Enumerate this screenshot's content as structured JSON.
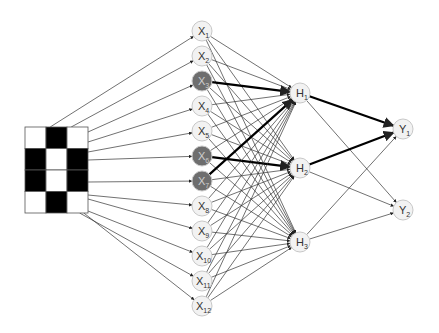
{
  "diagram": {
    "title": "",
    "type": "neural-network",
    "colors": {
      "background": "#ffffff",
      "node_fill": "#f2f2f2",
      "node_stroke": "#c8c8c8",
      "active_node_fill": "#6e6e6e",
      "edge": "#333333",
      "strong_edge": "#000000",
      "pixel_on": "#000000",
      "pixel_off": "#ffffff"
    },
    "input_grid": {
      "rows": 4,
      "cols": 3,
      "cells": [
        [
          0,
          1,
          0
        ],
        [
          1,
          0,
          1
        ],
        [
          1,
          0,
          1
        ],
        [
          0,
          1,
          0
        ]
      ]
    },
    "input_layer": [
      {
        "id": "X1",
        "letter": "X",
        "sub": "1",
        "active": false
      },
      {
        "id": "X2",
        "letter": "X",
        "sub": "2",
        "active": false
      },
      {
        "id": "X3",
        "letter": "X",
        "sub": "3",
        "active": true
      },
      {
        "id": "X4",
        "letter": "X",
        "sub": "4",
        "active": false
      },
      {
        "id": "X5",
        "letter": "X",
        "sub": "5",
        "active": false
      },
      {
        "id": "X6",
        "letter": "X",
        "sub": "6",
        "active": true
      },
      {
        "id": "X7",
        "letter": "X",
        "sub": "7",
        "active": true
      },
      {
        "id": "X8",
        "letter": "X",
        "sub": "8",
        "active": false
      },
      {
        "id": "X9",
        "letter": "X",
        "sub": "9",
        "active": false
      },
      {
        "id": "X10",
        "letter": "X",
        "sub": "10",
        "active": false
      },
      {
        "id": "X11",
        "letter": "X",
        "sub": "11",
        "active": false
      },
      {
        "id": "X12",
        "letter": "X",
        "sub": "12",
        "active": false
      }
    ],
    "hidden_layer": [
      {
        "id": "H1",
        "letter": "H",
        "sub": "1"
      },
      {
        "id": "H2",
        "letter": "H",
        "sub": "2"
      },
      {
        "id": "H3",
        "letter": "H",
        "sub": "3"
      }
    ],
    "output_layer": [
      {
        "id": "Y1",
        "letter": "Y",
        "sub": "1"
      },
      {
        "id": "Y2",
        "letter": "Y",
        "sub": "2"
      }
    ],
    "strong_connections": [
      [
        "X3",
        "H1"
      ],
      [
        "X7",
        "H1"
      ],
      [
        "X6",
        "H2"
      ],
      [
        "H1",
        "Y1"
      ],
      [
        "H2",
        "Y1"
      ]
    ]
  }
}
